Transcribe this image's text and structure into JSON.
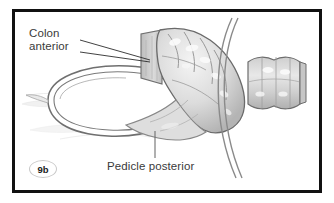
{
  "figure": {
    "id_badge": "9b",
    "title_alt": "Colon anterior / Pedicle posterior anatomical illustration",
    "background_color": "#ffffff",
    "frame_color": "#111111",
    "line_color": "#6b6b6b",
    "tissue_fill": "#d8d8d8",
    "tissue_light": "#f2f2f2",
    "tissue_shadow": "#a9a9a9",
    "text_color": "#3a3a3a"
  },
  "labels": {
    "colon": {
      "line1": "Colon",
      "line2": "anterior"
    },
    "pedicle": "Pedicle posterior"
  },
  "structures": [
    {
      "name": "colon-segment",
      "description": "lobulated bowel loop, upper center"
    },
    {
      "name": "pedicle-ring",
      "description": "large oval pedicle ring, left center"
    },
    {
      "name": "abdominal-wall-arc",
      "description": "curved double line, right"
    },
    {
      "name": "distal-bowel-segment",
      "description": "tubular bowel stump, far right"
    },
    {
      "name": "mesentery-wisp",
      "description": "faint tissue strands, left"
    }
  ]
}
